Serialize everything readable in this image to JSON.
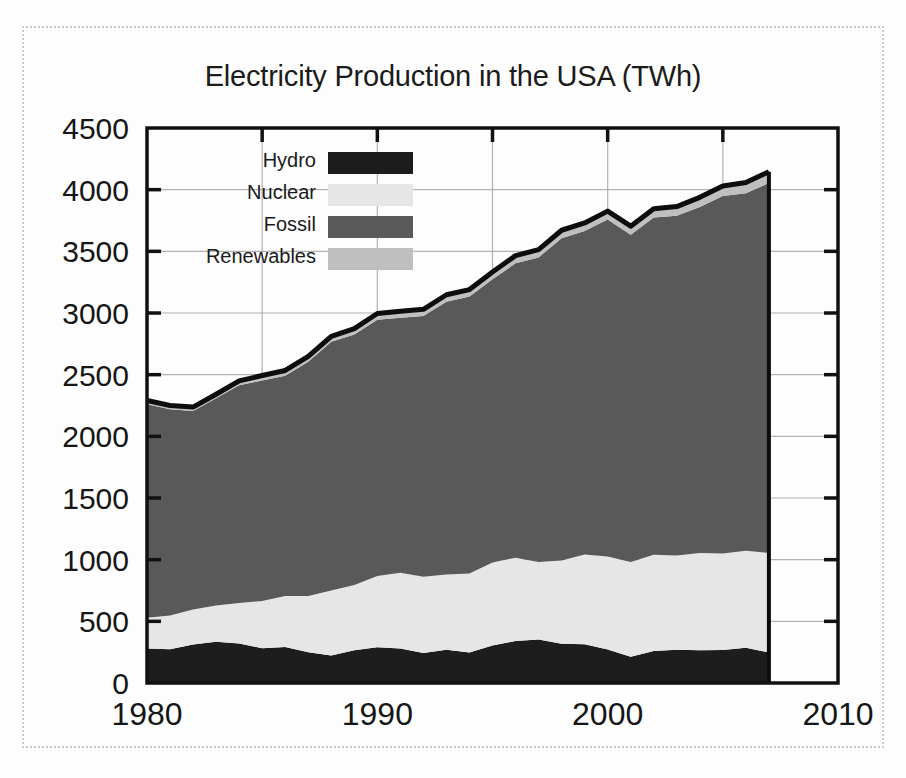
{
  "chart_data": {
    "type": "area",
    "stacked": true,
    "title": "Electricity Production in the USA (TWh)",
    "xlabel": "",
    "ylabel": "",
    "xlim": [
      1980,
      2010
    ],
    "ylim": [
      0,
      4500
    ],
    "grid": true,
    "legend_position": "top-left-inside",
    "x_tick_labels": [
      "1980",
      "1990",
      "2000",
      "2010"
    ],
    "x_ticks": [
      1980,
      1990,
      2000,
      2010
    ],
    "x_minor_ticks": [
      1985,
      1995,
      2005
    ],
    "y_tick_labels": [
      "0",
      "500",
      "1000",
      "1500",
      "2000",
      "2500",
      "3000",
      "3500",
      "4000",
      "4500"
    ],
    "y_ticks": [
      0,
      500,
      1000,
      1500,
      2000,
      2500,
      3000,
      3500,
      4000,
      4500
    ],
    "x": [
      1980,
      1981,
      1982,
      1983,
      1984,
      1985,
      1986,
      1987,
      1988,
      1989,
      1990,
      1991,
      1992,
      1993,
      1994,
      1995,
      1996,
      1997,
      1998,
      1999,
      2000,
      2001,
      2002,
      2003,
      2004,
      2005,
      2006,
      2007
    ],
    "series": [
      {
        "name": "Hydro",
        "color": "#1d1d1d",
        "values": [
          279,
          274,
          312,
          334,
          321,
          281,
          291,
          250,
          223,
          266,
          290,
          280,
          243,
          269,
          247,
          304,
          341,
          353,
          319,
          314,
          271,
          213,
          260,
          270,
          265,
          267,
          286,
          248
        ]
      },
      {
        "name": "Nuclear",
        "color": "#e6e6e6",
        "values": [
          251,
          273,
          283,
          294,
          328,
          384,
          414,
          455,
          527,
          529,
          577,
          613,
          619,
          610,
          640,
          673,
          675,
          629,
          674,
          728,
          754,
          769,
          780,
          764,
          789,
          782,
          787,
          806
        ]
      },
      {
        "name": "Fossil",
        "color": "#595959",
        "values": [
          1730,
          1673,
          1610,
          1680,
          1765,
          1788,
          1787,
          1900,
          2016,
          2030,
          2078,
          2068,
          2113,
          2213,
          2246,
          2296,
          2387,
          2469,
          2613,
          2622,
          2733,
          2652,
          2734,
          2754,
          2806,
          2899,
          2897,
          3000
        ]
      },
      {
        "name": "Renewables",
        "color": "#bfbfbf",
        "values": [
          30,
          30,
          32,
          33,
          36,
          40,
          42,
          43,
          45,
          48,
          51,
          53,
          55,
          56,
          57,
          60,
          62,
          63,
          65,
          66,
          68,
          70,
          72,
          75,
          78,
          82,
          88,
          92
        ]
      }
    ],
    "totals": [
      2290,
      2250,
      2237,
      2341,
      2450,
      2493,
      2534,
      2648,
      2811,
      2873,
      2996,
      3014,
      3030,
      3148,
      3190,
      3333,
      3465,
      3514,
      3671,
      3730,
      3826,
      3704,
      3846,
      3863,
      3938,
      4030,
      4058,
      4146
    ]
  },
  "legend": {
    "items": [
      {
        "label": "Hydro",
        "color": "#1d1d1d"
      },
      {
        "label": "Nuclear",
        "color": "#e6e6e6"
      },
      {
        "label": "Fossil",
        "color": "#595959"
      },
      {
        "label": "Renewables",
        "color": "#bfbfbf"
      }
    ]
  },
  "colors": {
    "axis": "#111111",
    "grid": "#b2b2b2",
    "outline": "#0d0d0d",
    "background": "#fdfdfd",
    "frame": "#c9c9c9"
  }
}
